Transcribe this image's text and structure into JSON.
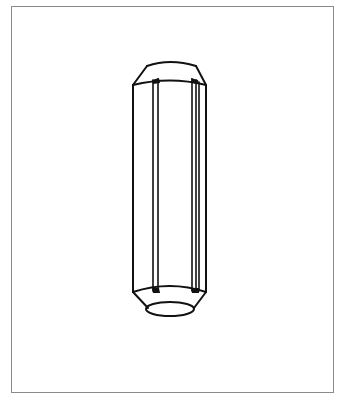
{
  "figure": {
    "view": "perspective line drawing",
    "colors": {
      "background": "#ffffff",
      "frame_border": "#8a8a8a",
      "line": "#111111"
    }
  }
}
